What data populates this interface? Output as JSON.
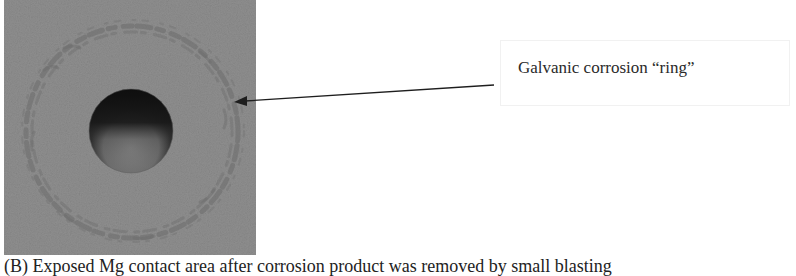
{
  "figure": {
    "photo": {
      "description": "Grayscale photograph of a metal surface with a circular hole surrounded by a galvanic corrosion ring",
      "colors": {
        "surface": "#8e8e8e",
        "ring": "#6f6f6f",
        "hole_dark": "#141414",
        "hole_floor": "#7a7a7a"
      }
    },
    "annotation": {
      "label": "Galvanic corrosion “ring”",
      "arrow_icon": "arrow-left-icon"
    },
    "caption": "(B) Exposed Mg contact area after corrosion product was removed by small blasting"
  }
}
